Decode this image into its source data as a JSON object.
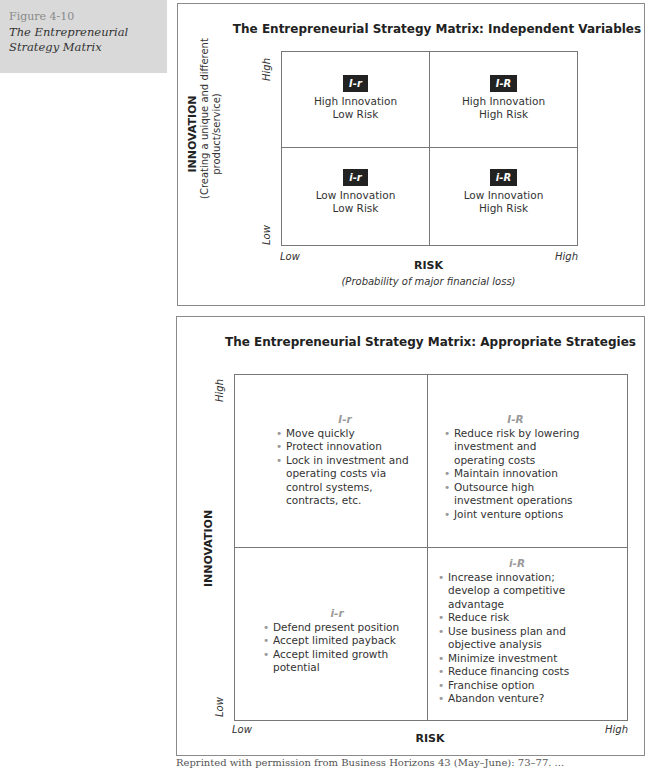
{
  "figure": {
    "number": "Figure 4-10",
    "title_line1": "The Entrepreneurial",
    "title_line2": "Strategy Matrix"
  },
  "panel1": {
    "title": "The Entrepreneurial Strategy Matrix: Independent Variables",
    "y_axis": {
      "title": "INNOVATION",
      "subtitle_line1": "(Creating a unique and different",
      "subtitle_line2": "product/service)",
      "high": "High",
      "low": "Low"
    },
    "x_axis": {
      "title": "RISK",
      "subtitle": "(Probability of major financial loss)",
      "low": "Low",
      "high": "High"
    },
    "cells": [
      {
        "code": "I-r",
        "line1": "High Innovation",
        "line2": "Low Risk"
      },
      {
        "code": "I-R",
        "line1": "High Innovation",
        "line2": "High Risk"
      },
      {
        "code": "i-r",
        "line1": "Low Innovation",
        "line2": "Low Risk"
      },
      {
        "code": "i-R",
        "line1": "Low Innovation",
        "line2": "High Risk"
      }
    ]
  },
  "panel2": {
    "title": "The Entrepreneurial Strategy Matrix: Appropriate Strategies",
    "y_axis": {
      "title": "INNOVATION",
      "high": "High",
      "low": "Low"
    },
    "x_axis": {
      "title": "RISK",
      "low": "Low",
      "high": "High"
    },
    "cells": [
      {
        "code": "I-r",
        "items": [
          "Move quickly",
          "Protect innovation",
          "Lock in investment and operating costs via control systems, contracts, etc."
        ]
      },
      {
        "code": "I-R",
        "items": [
          "Reduce risk by lowering investment and operating costs",
          "Maintain innovation",
          "Outsource high investment operations",
          "Joint venture options"
        ]
      },
      {
        "code": "i-r",
        "items": [
          "Defend present position",
          "Accept limited payback",
          "Accept limited growth potential"
        ]
      },
      {
        "code": "i-R",
        "items": [
          "Increase innovation; develop a competitive advantage",
          "Reduce risk",
          "Use business plan and objective analysis",
          "Minimize investment",
          "Reduce financing costs",
          "Franchise option",
          "Abandon venture?"
        ]
      }
    ]
  },
  "caption": "Reprinted with permission from Business Horizons 43 (May–June): 73–77. ..."
}
